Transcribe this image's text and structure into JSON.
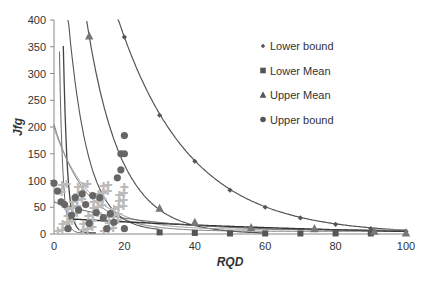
{
  "chart_data": {
    "type": "scatter",
    "title": "",
    "xlabel": "RQD",
    "ylabel": "Jfg",
    "xlim": [
      0,
      100
    ],
    "ylim": [
      0,
      400
    ],
    "xticks": [
      0,
      20,
      40,
      60,
      80,
      100
    ],
    "yticks": [
      0,
      50,
      100,
      150,
      200,
      250,
      300,
      350,
      400
    ],
    "grid": false,
    "legend_position": "upper right (inside plot)",
    "series": [
      {
        "name": "Lower bound",
        "marker": "diamond",
        "color": "#555555",
        "x": [
          20,
          30,
          40,
          50,
          60,
          70,
          80,
          90,
          100
        ],
        "y": [
          368,
          222,
          136,
          82,
          50,
          30,
          18,
          10,
          5
        ]
      },
      {
        "name": "Lower Mean",
        "marker": "square",
        "color": "#555555",
        "x": [
          30,
          40,
          50,
          60,
          70,
          80,
          90
        ],
        "y": [
          3,
          2,
          1,
          1,
          1,
          1,
          1
        ]
      },
      {
        "name": "Upper Mean",
        "marker": "triangle",
        "color": "#777777",
        "x": [
          10,
          30,
          40,
          56,
          74,
          91,
          100
        ],
        "y": [
          370,
          48,
          22,
          12,
          10,
          5,
          2
        ]
      },
      {
        "name": "Upper bound",
        "marker": "circle",
        "color": "#666666",
        "x": [
          0,
          1,
          2,
          3,
          4,
          5,
          6,
          7,
          8,
          9,
          10,
          11,
          12,
          13,
          14,
          15,
          16,
          17,
          18,
          19,
          19,
          20,
          20,
          20
        ],
        "y": [
          95,
          80,
          60,
          55,
          10,
          35,
          68,
          45,
          75,
          55,
          20,
          72,
          40,
          68,
          30,
          10,
          38,
          22,
          105,
          120,
          150,
          184,
          150,
          10
        ]
      }
    ],
    "fitted_curves": [
      {
        "label": "steep curve A",
        "approx": "vertical near RQD 2-5, drops to ~0 by RQD 10"
      },
      {
        "label": "steep curve B",
        "approx": "from ~200 at RQD 0 decaying to ~25 at RQD 20"
      },
      {
        "label": "Upper Mean fit",
        "approx": "400 at RQD 9 decaying to ~5 at RQD 100"
      },
      {
        "label": "Lower bound fit",
        "approx": "400 at RQD 18 decaying to ~5 at RQD 100"
      },
      {
        "label": "flat curves",
        "approx": "~40 at RQD 0-10 flattening to ~5 at RQD 100"
      }
    ]
  },
  "legend": {
    "items": [
      {
        "label": "Lower bound",
        "marker": "diamond"
      },
      {
        "label": "Lower Mean",
        "marker": "square"
      },
      {
        "label": "Upper Mean",
        "marker": "triangle"
      },
      {
        "label": "Upper bound",
        "marker": "circle"
      }
    ]
  },
  "axes": {
    "x_title": "RQD",
    "y_title": "Jfg",
    "x_ticks": [
      "0",
      "20",
      "40",
      "60",
      "80",
      "100"
    ],
    "y_ticks": [
      "0",
      "50",
      "100",
      "150",
      "200",
      "250",
      "300",
      "350",
      "400"
    ]
  }
}
